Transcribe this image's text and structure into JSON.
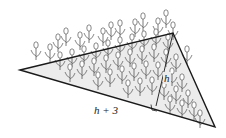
{
  "diagram": {
    "labels": {
      "height": "h",
      "base": "h + 3"
    },
    "markers": {
      "right_angle": true
    },
    "colors": {
      "line": "#1a1a1a",
      "fill": "#ececec",
      "flower": "#555555"
    }
  }
}
